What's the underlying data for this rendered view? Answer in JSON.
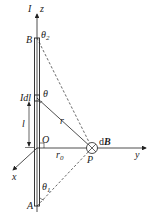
{
  "labels": {
    "current": "I",
    "z_axis": "z",
    "point_B": "B",
    "theta2": "θ",
    "theta2_sub": "2",
    "Idl_I": "I",
    "Idl_dl": "dl",
    "theta": "θ",
    "length_l": "l",
    "r": "r",
    "origin": "O",
    "r0": "r",
    "r0_sub": "0",
    "point_P": "P",
    "dB_d": "d",
    "dB_B": "B",
    "y_axis": "y",
    "x_axis": "x",
    "theta1": "θ",
    "theta1_sub": "1",
    "point_A": "A"
  }
}
